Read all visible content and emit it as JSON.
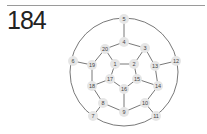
{
  "header": {
    "number": "184"
  },
  "diagram": {
    "type": "graph",
    "outer_circle": {
      "cx": 124,
      "cy": 72,
      "r": 54
    },
    "nodes": [
      {
        "id": "1",
        "x": 115,
        "y": 64
      },
      {
        "id": "2",
        "x": 134,
        "y": 64
      },
      {
        "id": "3",
        "x": 145,
        "y": 48
      },
      {
        "id": "4",
        "x": 124,
        "y": 42
      },
      {
        "id": "5",
        "x": 124,
        "y": 19
      },
      {
        "id": "6",
        "x": 73,
        "y": 61
      },
      {
        "id": "7",
        "x": 93,
        "y": 116
      },
      {
        "id": "8",
        "x": 103,
        "y": 103
      },
      {
        "id": "9",
        "x": 124,
        "y": 112
      },
      {
        "id": "10",
        "x": 145,
        "y": 103
      },
      {
        "id": "11",
        "x": 156,
        "y": 116
      },
      {
        "id": "12",
        "x": 176,
        "y": 61
      },
      {
        "id": "13",
        "x": 155,
        "y": 66
      },
      {
        "id": "14",
        "x": 158,
        "y": 86
      },
      {
        "id": "15",
        "x": 137,
        "y": 79
      },
      {
        "id": "16",
        "x": 124,
        "y": 89
      },
      {
        "id": "17",
        "x": 110,
        "y": 79
      },
      {
        "id": "18",
        "x": 92,
        "y": 86
      },
      {
        "id": "19",
        "x": 92,
        "y": 65
      },
      {
        "id": "20",
        "x": 105,
        "y": 49
      }
    ],
    "edges": [
      [
        "5",
        "4"
      ],
      [
        "4",
        "20"
      ],
      [
        "4",
        "3"
      ],
      [
        "20",
        "19"
      ],
      [
        "20",
        "1"
      ],
      [
        "3",
        "2"
      ],
      [
        "3",
        "13"
      ],
      [
        "1",
        "2"
      ],
      [
        "1",
        "17"
      ],
      [
        "2",
        "15"
      ],
      [
        "19",
        "6"
      ],
      [
        "19",
        "18"
      ],
      [
        "13",
        "12"
      ],
      [
        "13",
        "14"
      ],
      [
        "18",
        "17"
      ],
      [
        "18",
        "8"
      ],
      [
        "17",
        "16"
      ],
      [
        "15",
        "16"
      ],
      [
        "15",
        "14"
      ],
      [
        "14",
        "10"
      ],
      [
        "16",
        "9"
      ],
      [
        "8",
        "9"
      ],
      [
        "8",
        "7"
      ],
      [
        "9",
        "10"
      ],
      [
        "10",
        "11"
      ]
    ]
  }
}
